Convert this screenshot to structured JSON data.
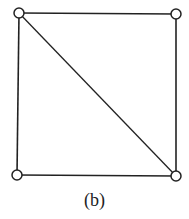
{
  "diagram": {
    "caption": "(b)",
    "vertices": [
      {
        "id": "top-left",
        "x": 19,
        "y": 13
      },
      {
        "id": "top-right",
        "x": 176,
        "y": 14
      },
      {
        "id": "bottom-left",
        "x": 17,
        "y": 175
      },
      {
        "id": "bottom-right",
        "x": 176,
        "y": 176
      }
    ],
    "edges": [
      [
        "top-left",
        "top-right"
      ],
      [
        "top-right",
        "bottom-right"
      ],
      [
        "bottom-right",
        "bottom-left"
      ],
      [
        "bottom-left",
        "top-left"
      ],
      [
        "top-left",
        "bottom-right"
      ]
    ],
    "stroke_color": "#222222",
    "vertex_fill": "#ffffff"
  }
}
